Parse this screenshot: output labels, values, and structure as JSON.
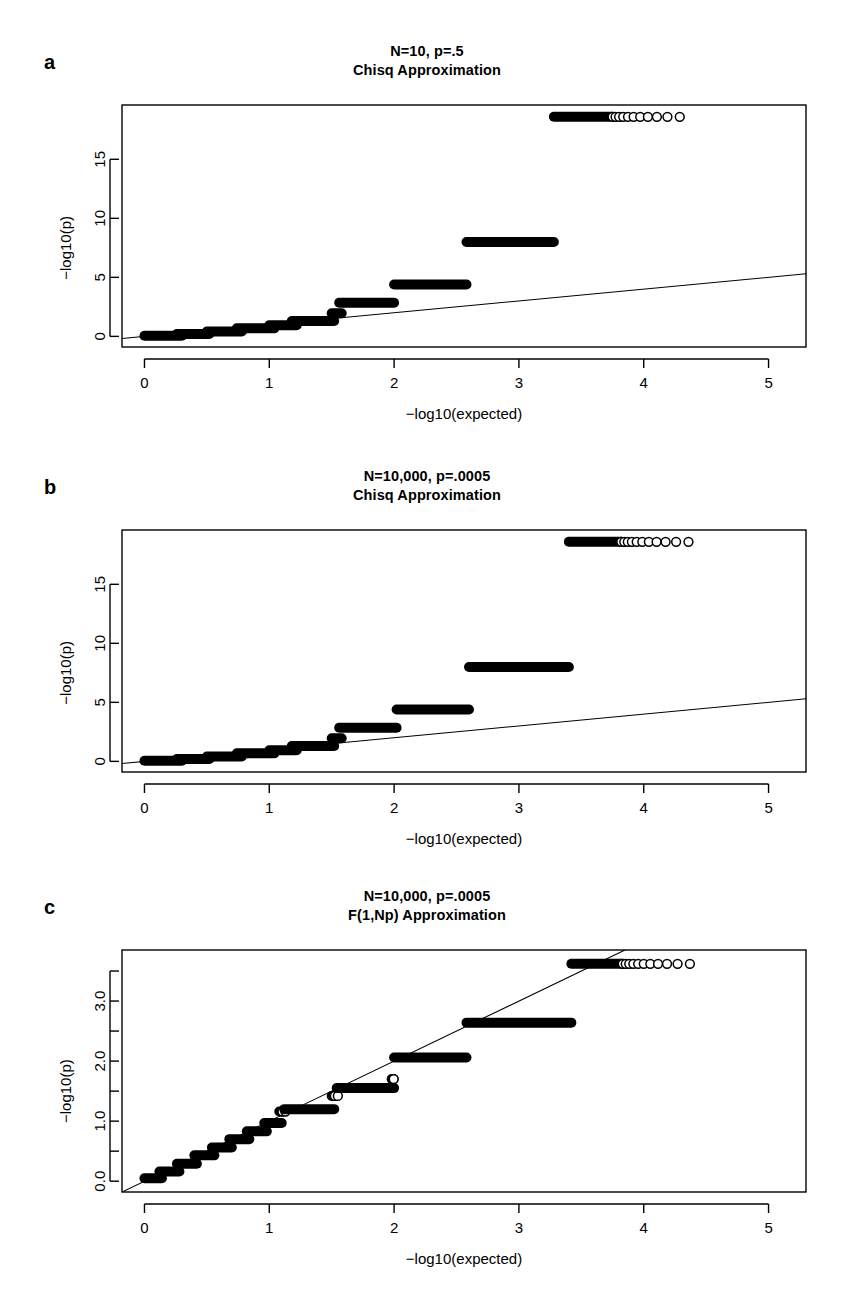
{
  "figure": {
    "background": "#ffffff",
    "ink": "#000000",
    "axis_title_x": "−log10(expected)",
    "axis_title_y": "−log10(p)"
  },
  "panels": [
    {
      "letter": "a",
      "title_line1": "N=10, p=.5",
      "title_line2": "Chisq Approximation",
      "chart_data": {
        "type": "scatter",
        "title": "N=10, p=.5 — Chisq Approximation",
        "xlabel": "−log10(expected)",
        "ylabel": "−log10(p)",
        "xlim": [
          -0.18,
          5.3
        ],
        "ylim": [
          -0.9,
          19.6
        ],
        "xticks": [
          0,
          1,
          2,
          3,
          4,
          5
        ],
        "xticklabels": [
          "0",
          "1",
          "2",
          "3",
          "4",
          "5"
        ],
        "yticks": [
          0,
          5,
          10,
          15
        ],
        "yticklabels": [
          "0",
          "5",
          "10",
          "15"
        ],
        "grid": false,
        "legend": false,
        "reference_line": {
          "type": "identity",
          "x": [
            -0.18,
            5.3
          ],
          "y": [
            -0.18,
            5.3
          ],
          "note": "y=x diagonal"
        },
        "ceiling_value": 18.6,
        "steps": [
          {
            "y": 0.05,
            "x_start": 0.0,
            "x_end": 0.3,
            "marker": "filled"
          },
          {
            "y": 0.2,
            "x_start": 0.26,
            "x_end": 0.52,
            "marker": "filled"
          },
          {
            "y": 0.42,
            "x_start": 0.5,
            "x_end": 0.78,
            "marker": "filled"
          },
          {
            "y": 0.68,
            "x_start": 0.74,
            "x_end": 1.04,
            "marker": "filled"
          },
          {
            "y": 0.95,
            "x_start": 1.0,
            "x_end": 1.22,
            "marker": "filled"
          },
          {
            "y": 1.3,
            "x_start": 1.18,
            "x_end": 1.52,
            "marker": "filled"
          },
          {
            "y": 1.95,
            "x_start": 1.5,
            "x_end": 1.58,
            "marker": "filled"
          },
          {
            "y": 2.85,
            "x_start": 1.56,
            "x_end": 2.0,
            "marker": "filled"
          },
          {
            "y": 4.4,
            "x_start": 2.0,
            "x_end": 2.58,
            "marker": "filled"
          },
          {
            "y": 8.0,
            "x_start": 2.58,
            "x_end": 3.28,
            "marker": "filled"
          },
          {
            "y": 18.6,
            "x_start": 3.28,
            "x_end": 4.4,
            "marker": "mixed"
          }
        ]
      }
    },
    {
      "letter": "b",
      "title_line1": "N=10,000, p=.0005",
      "title_line2": "Chisq Approximation",
      "chart_data": {
        "type": "scatter",
        "title": "N=10,000, p=.0005 — Chisq Approximation",
        "xlabel": "−log10(expected)",
        "ylabel": "−log10(p)",
        "xlim": [
          -0.18,
          5.3
        ],
        "ylim": [
          -0.9,
          19.6
        ],
        "xticks": [
          0,
          1,
          2,
          3,
          4,
          5
        ],
        "xticklabels": [
          "0",
          "1",
          "2",
          "3",
          "4",
          "5"
        ],
        "yticks": [
          0,
          5,
          10,
          15
        ],
        "yticklabels": [
          "0",
          "5",
          "10",
          "15"
        ],
        "grid": false,
        "legend": false,
        "reference_line": {
          "type": "identity",
          "x": [
            -0.18,
            5.3
          ],
          "y": [
            -0.18,
            5.3
          ],
          "note": "y=x diagonal"
        },
        "ceiling_value": 18.6,
        "steps": [
          {
            "y": 0.05,
            "x_start": 0.0,
            "x_end": 0.3,
            "marker": "filled"
          },
          {
            "y": 0.2,
            "x_start": 0.26,
            "x_end": 0.52,
            "marker": "filled"
          },
          {
            "y": 0.42,
            "x_start": 0.5,
            "x_end": 0.78,
            "marker": "filled"
          },
          {
            "y": 0.68,
            "x_start": 0.74,
            "x_end": 1.04,
            "marker": "filled"
          },
          {
            "y": 0.95,
            "x_start": 1.0,
            "x_end": 1.22,
            "marker": "filled"
          },
          {
            "y": 1.3,
            "x_start": 1.18,
            "x_end": 1.52,
            "marker": "filled"
          },
          {
            "y": 1.95,
            "x_start": 1.5,
            "x_end": 1.58,
            "marker": "filled"
          },
          {
            "y": 2.85,
            "x_start": 1.56,
            "x_end": 2.02,
            "marker": "filled"
          },
          {
            "y": 4.4,
            "x_start": 2.02,
            "x_end": 2.6,
            "marker": "filled"
          },
          {
            "y": 8.0,
            "x_start": 2.6,
            "x_end": 3.4,
            "marker": "filled"
          },
          {
            "y": 18.6,
            "x_start": 3.4,
            "x_end": 4.4,
            "marker": "mixed"
          }
        ]
      }
    },
    {
      "letter": "c",
      "title_line1": "N=10,000, p=.0005",
      "title_line2": "F(1,Np) Approximation",
      "chart_data": {
        "type": "scatter",
        "title": "N=10,000, p=.0005 — F(1,Np) Approximation",
        "xlabel": "−log10(expected)",
        "ylabel": "−log10(p)",
        "xlim": [
          -0.18,
          5.3
        ],
        "ylim": [
          -0.18,
          3.85
        ],
        "xticks": [
          0,
          1,
          2,
          3,
          4,
          5
        ],
        "xticklabels": [
          "0",
          "1",
          "2",
          "3",
          "4",
          "5"
        ],
        "yticks": [
          0.0,
          1.0,
          2.0,
          3.0
        ],
        "yticklabels": [
          "0.0",
          "1.0",
          "2.0",
          "3.0"
        ],
        "yminorticks": [
          0.5,
          1.5,
          2.5,
          3.5
        ],
        "grid": false,
        "legend": false,
        "reference_line": {
          "type": "identity",
          "x": [
            -0.18,
            5.3
          ],
          "y": [
            -0.18,
            5.3
          ],
          "note": "y=x diagonal"
        },
        "ceiling_value": 3.62,
        "steps": [
          {
            "y": 0.05,
            "x_start": 0.0,
            "x_end": 0.14,
            "marker": "filled"
          },
          {
            "y": 0.16,
            "x_start": 0.12,
            "x_end": 0.28,
            "marker": "filled"
          },
          {
            "y": 0.29,
            "x_start": 0.26,
            "x_end": 0.42,
            "marker": "filled"
          },
          {
            "y": 0.43,
            "x_start": 0.4,
            "x_end": 0.56,
            "marker": "filled"
          },
          {
            "y": 0.56,
            "x_start": 0.54,
            "x_end": 0.7,
            "marker": "filled"
          },
          {
            "y": 0.7,
            "x_start": 0.68,
            "x_end": 0.84,
            "marker": "filled"
          },
          {
            "y": 0.83,
            "x_start": 0.82,
            "x_end": 0.98,
            "marker": "filled"
          },
          {
            "y": 0.97,
            "x_start": 0.96,
            "x_end": 1.1,
            "marker": "filled"
          },
          {
            "y": 1.16,
            "x_start": 1.08,
            "x_end": 1.14,
            "marker": "mixed"
          },
          {
            "y": 1.2,
            "x_start": 1.12,
            "x_end": 1.52,
            "marker": "filled"
          },
          {
            "y": 1.42,
            "x_start": 1.5,
            "x_end": 1.56,
            "marker": "mixed"
          },
          {
            "y": 1.55,
            "x_start": 1.54,
            "x_end": 2.0,
            "marker": "filled"
          },
          {
            "y": 1.7,
            "x_start": 1.98,
            "x_end": 2.02,
            "marker": "mixed"
          },
          {
            "y": 2.06,
            "x_start": 2.0,
            "x_end": 2.58,
            "marker": "filled"
          },
          {
            "y": 2.64,
            "x_start": 2.58,
            "x_end": 3.42,
            "marker": "filled"
          },
          {
            "y": 3.62,
            "x_start": 3.42,
            "x_end": 4.4,
            "marker": "mixed"
          }
        ]
      }
    }
  ]
}
